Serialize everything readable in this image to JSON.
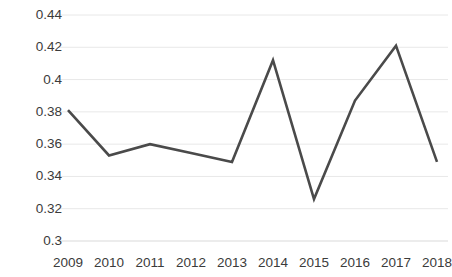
{
  "chart_data": {
    "type": "line",
    "title": "",
    "subtitle": "",
    "xlabel": "",
    "ylabel": "",
    "categories": [
      "2009",
      "2010",
      "2011",
      "2012",
      "2013",
      "2014",
      "2015",
      "2016",
      "2017",
      "2018"
    ],
    "series": [
      {
        "name": "",
        "values": [
          0.381,
          0.353,
          0.36,
          0.3545,
          0.349,
          0.412,
          0.326,
          0.387,
          0.421,
          0.349
        ],
        "color": "#4a4a4a",
        "line_width": 2.6,
        "markers": false
      }
    ],
    "ylim": [
      0.3,
      0.44
    ],
    "yticks": [
      0.3,
      0.32,
      0.34,
      0.36,
      0.38,
      0.4,
      0.42,
      0.44
    ],
    "ytick_labels": [
      "0.3",
      "0.32",
      "0.34",
      "0.36",
      "0.38",
      "0.4",
      "0.42",
      "0.44"
    ],
    "xtick_labels": [
      "2009",
      "2010",
      "2011",
      "2012",
      "2013",
      "2014",
      "2015",
      "2016",
      "2017",
      "2018"
    ],
    "grid": {
      "horizontal": true,
      "vertical": false,
      "color": "#e8e8e8"
    },
    "legend": {
      "visible": false,
      "position": "none"
    },
    "axis": {
      "bottom_line_color": "#d9d9d9",
      "left_line": false,
      "tick_label_color": "#3b3b3b"
    },
    "plot_area": {
      "left": 68,
      "right": 437,
      "top": 15,
      "bottom": 241
    }
  }
}
